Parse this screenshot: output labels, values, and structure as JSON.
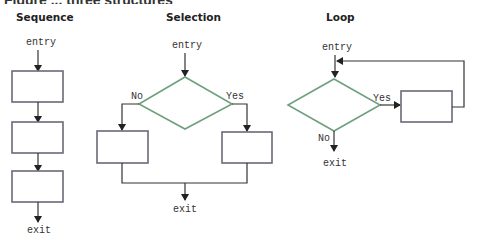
{
  "figure": {
    "title_fragment": "Figure ... three structures",
    "colors": {
      "box_stroke": "#6a6a7a",
      "decision_stroke": "#6fa07e",
      "line": "#333333"
    }
  },
  "panels": {
    "sequence": {
      "title": "Sequence",
      "entry": "entry",
      "exit": "exit",
      "process_boxes": 3
    },
    "selection": {
      "title": "Selection",
      "entry": "entry",
      "exit": "exit",
      "no_label": "No",
      "yes_label": "Yes",
      "process_boxes": 2
    },
    "loop": {
      "title": "Loop",
      "entry": "entry",
      "exit": "exit",
      "no_label": "No",
      "yes_label": "Yes",
      "process_boxes": 1
    }
  }
}
